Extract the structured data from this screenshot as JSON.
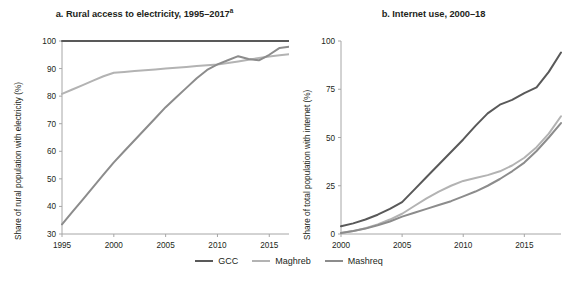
{
  "figure": {
    "background": "#ffffff",
    "series_colors": {
      "GCC": "#595959",
      "Maghreb": "#b3b3b3",
      "Mashreq": "#8c8c8c"
    },
    "axis_color": "#a6a6a6",
    "text_color": "#231f20"
  },
  "legend": {
    "position": "bottom-center",
    "items": [
      {
        "label": "GCC",
        "color": "#595959",
        "name": "legend-item-gcc"
      },
      {
        "label": "Maghreb",
        "color": "#b3b3b3",
        "name": "legend-item-maghreb"
      },
      {
        "label": "Mashreq",
        "color": "#8c8c8c",
        "name": "legend-item-mashreq"
      }
    ]
  },
  "panel_a": {
    "title_main": "a. Rural access to electricity, 1995–2017",
    "title_super": "a",
    "ylabel": "Share of rural population with electricity (%)",
    "xlabel": "",
    "xticks": [
      "1995",
      "2000",
      "2005",
      "2010",
      "2015"
    ],
    "yticks": [
      "30",
      "40",
      "50",
      "60",
      "70",
      "80",
      "90",
      "100"
    ]
  },
  "panel_b": {
    "title_main": "b. Internet use, 2000–18",
    "title_super": "",
    "ylabel": "Share of total population with internet (%)",
    "xlabel": "",
    "xticks": [
      "2000",
      "2005",
      "2010",
      "2015"
    ],
    "yticks": [
      "0",
      "25",
      "50",
      "75",
      "100"
    ]
  },
  "chart_data": [
    {
      "type": "line",
      "panel": "a",
      "title": "a. Rural access to electricity, 1995–2017a",
      "xlabel": "",
      "ylabel": "Share of rural population with electricity (%)",
      "xlim": [
        1995,
        2017
      ],
      "ylim": [
        30,
        100
      ],
      "xticks": [
        1995,
        2000,
        2005,
        2010,
        2015
      ],
      "yticks": [
        30,
        40,
        50,
        60,
        70,
        80,
        90,
        100
      ],
      "grid": false,
      "legend_position": "bottom-center",
      "x": [
        1995,
        1996,
        1997,
        1998,
        1999,
        2000,
        2001,
        2002,
        2003,
        2004,
        2005,
        2006,
        2007,
        2008,
        2009,
        2010,
        2011,
        2012,
        2013,
        2014,
        2015,
        2016,
        2017
      ],
      "series": [
        {
          "name": "GCC",
          "color": "#595959",
          "values": [
            100,
            100,
            100,
            100,
            100,
            100,
            100,
            100,
            100,
            100,
            100,
            100,
            100,
            100,
            100,
            100,
            100,
            100,
            100,
            100,
            100,
            100,
            100
          ]
        },
        {
          "name": "Maghreb",
          "color": "#b3b3b3",
          "values": [
            80.8,
            82.4,
            84.0,
            85.6,
            87.2,
            88.5,
            88.8,
            89.1,
            89.4,
            89.7,
            90.0,
            90.3,
            90.6,
            90.9,
            91.2,
            91.5,
            92.0,
            92.6,
            93.2,
            93.8,
            94.4,
            94.8,
            95.2
          ]
        },
        {
          "name": "Mashreq",
          "color": "#8c8c8c",
          "values": [
            33.5,
            38.0,
            42.5,
            47.0,
            51.5,
            56.0,
            60.0,
            64.0,
            68.0,
            72.0,
            76.0,
            79.5,
            83.0,
            86.5,
            89.5,
            91.5,
            93.0,
            94.5,
            93.5,
            93.0,
            95.0,
            97.5,
            98.0
          ]
        }
      ]
    },
    {
      "type": "line",
      "panel": "b",
      "title": "b. Internet use, 2000–18",
      "xlabel": "",
      "ylabel": "Share of total population with internet (%)",
      "xlim": [
        2000,
        2018
      ],
      "ylim": [
        0,
        100
      ],
      "xticks": [
        2000,
        2005,
        2010,
        2015
      ],
      "yticks": [
        0,
        25,
        50,
        75,
        100
      ],
      "grid": false,
      "legend_position": "bottom-center",
      "x": [
        2000,
        2001,
        2002,
        2003,
        2004,
        2005,
        2006,
        2007,
        2008,
        2009,
        2010,
        2011,
        2012,
        2013,
        2014,
        2015,
        2016,
        2017,
        2018
      ],
      "series": [
        {
          "name": "GCC",
          "color": "#595959",
          "values": [
            4.0,
            5.5,
            7.5,
            10.0,
            13.0,
            16.5,
            23.0,
            29.5,
            36.0,
            42.5,
            49.0,
            56.0,
            62.5,
            67.0,
            69.5,
            73.0,
            76.0,
            84.0,
            94.0
          ]
        },
        {
          "name": "Maghreb",
          "color": "#b3b3b3",
          "values": [
            0.5,
            1.5,
            3.0,
            5.0,
            7.5,
            10.5,
            14.5,
            18.5,
            22.0,
            25.0,
            27.5,
            29.0,
            30.5,
            32.5,
            35.5,
            39.5,
            45.0,
            52.0,
            61.0
          ]
        },
        {
          "name": "Mashreq",
          "color": "#8c8c8c",
          "values": [
            0.5,
            1.5,
            2.8,
            4.5,
            6.5,
            9.0,
            11.0,
            13.0,
            15.0,
            17.0,
            19.5,
            22.0,
            25.0,
            28.5,
            32.5,
            37.0,
            43.0,
            50.0,
            57.5
          ]
        }
      ]
    }
  ]
}
